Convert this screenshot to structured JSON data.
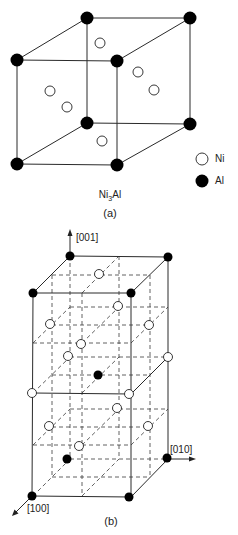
{
  "figure_a": {
    "formula_prefix": "Ni",
    "formula_sub": "3",
    "formula_suffix": "Al",
    "caption": "(a)",
    "legend": [
      {
        "symbol": "open-circle",
        "label": "Ni"
      },
      {
        "symbol": "filled-circle",
        "label": "Al"
      }
    ]
  },
  "figure_b": {
    "caption": "(b)",
    "axes": [
      {
        "direction": "up",
        "label": "[001]"
      },
      {
        "direction": "right",
        "label": "[010]"
      },
      {
        "direction": "down-left",
        "label": "[100]"
      }
    ]
  },
  "colors": {
    "al_atom": "#000000",
    "ni_atom": "#ffffff",
    "lines": "#2a2a2a"
  }
}
